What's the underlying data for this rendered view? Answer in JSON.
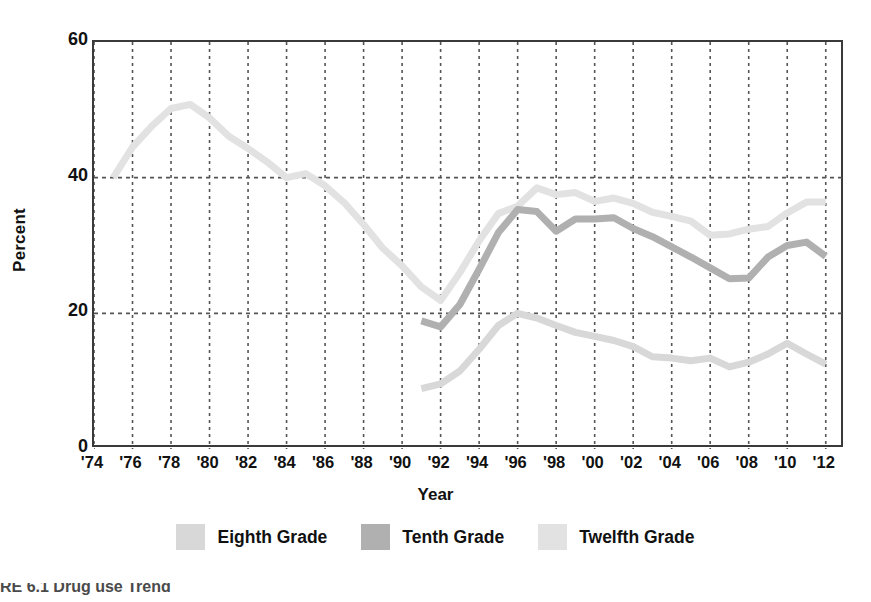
{
  "figure": {
    "caption": "RE 6.1  Drug use Trend"
  },
  "axes": {
    "y_title": "Percent",
    "x_title": "Year",
    "y_ticks": [
      "0",
      "20",
      "40",
      "60"
    ],
    "x_ticks": [
      "'74",
      "'76",
      "'78",
      "'80",
      "'82",
      "'84",
      "'86",
      "'88",
      "'90",
      "'92",
      "'94",
      "'96",
      "'98",
      "'00",
      "'02",
      "'04",
      "'06",
      "'08",
      "'10",
      "'12"
    ]
  },
  "legend": {
    "items": [
      {
        "label": "Eighth Grade",
        "color": "#d8d8d8"
      },
      {
        "label": "Tenth Grade",
        "color": "#b0b0b0"
      },
      {
        "label": "Twelfth Grade",
        "color": "#e2e2e2"
      }
    ]
  },
  "colors": {
    "eighth": "#d8d8d8",
    "tenth": "#b0b0b0",
    "twelfth": "#e2e2e2",
    "axis": "#3a3a3a",
    "grid": "#555555",
    "text": "#111111"
  },
  "chart_data": {
    "type": "line",
    "title": "",
    "xlabel": "Year",
    "ylabel": "Percent",
    "xlim": [
      1974,
      2013
    ],
    "ylim": [
      0,
      60
    ],
    "grid": "dashed vertical gridlines every 2 years; dashed horizontal gridlines at 20 and 40",
    "legend_position": "below plot, centered",
    "x": [
      1975,
      1976,
      1977,
      1978,
      1979,
      1980,
      1981,
      1982,
      1983,
      1984,
      1985,
      1986,
      1987,
      1988,
      1989,
      1990,
      1991,
      1992,
      1993,
      1994,
      1995,
      1996,
      1997,
      1998,
      1999,
      2000,
      2001,
      2002,
      2003,
      2004,
      2005,
      2006,
      2007,
      2008,
      2009,
      2010,
      2011,
      2012
    ],
    "series": [
      {
        "name": "Twelfth Grade",
        "color": "#e2e2e2",
        "x": [
          1975,
          1976,
          1977,
          1978,
          1979,
          1980,
          1981,
          1982,
          1983,
          1984,
          1985,
          1986,
          1987,
          1988,
          1989,
          1990,
          1991,
          1992,
          1993,
          1994,
          1995,
          1996,
          1997,
          1998,
          1999,
          2000,
          2001,
          2002,
          2003,
          2004,
          2005,
          2006,
          2007,
          2008,
          2009,
          2010,
          2011,
          2012
        ],
        "values": [
          40.0,
          44.5,
          47.6,
          50.2,
          50.8,
          48.8,
          46.1,
          44.3,
          42.3,
          40.0,
          40.6,
          38.8,
          36.3,
          33.1,
          29.6,
          27.0,
          23.9,
          21.9,
          26.0,
          30.7,
          34.7,
          35.8,
          38.5,
          37.5,
          37.8,
          36.5,
          37.0,
          36.2,
          34.9,
          34.3,
          33.6,
          31.5,
          31.7,
          32.4,
          32.8,
          34.8,
          36.4,
          36.4
        ]
      },
      {
        "name": "Tenth Grade",
        "color": "#b0b0b0",
        "x": [
          1991,
          1992,
          1993,
          1994,
          1995,
          1996,
          1997,
          1998,
          1999,
          2000,
          2001,
          2002,
          2003,
          2004,
          2005,
          2006,
          2007,
          2008,
          2009,
          2010,
          2011,
          2012
        ],
        "values": [
          18.9,
          18.0,
          21.3,
          26.5,
          31.9,
          35.3,
          35.0,
          32.1,
          33.9,
          33.9,
          34.1,
          32.5,
          31.3,
          29.8,
          28.3,
          26.7,
          25.1,
          25.2,
          28.3,
          30.0,
          30.5,
          28.4
        ]
      },
      {
        "name": "Eighth Grade",
        "color": "#d8d8d8",
        "x": [
          1991,
          1992,
          1993,
          1994,
          1995,
          1996,
          1997,
          1998,
          1999,
          2000,
          2001,
          2002,
          2003,
          2004,
          2005,
          2006,
          2007,
          2008,
          2009,
          2010,
          2011,
          2012
        ],
        "values": [
          8.9,
          9.6,
          11.5,
          14.7,
          18.2,
          20.0,
          19.3,
          18.2,
          17.2,
          16.6,
          16.0,
          15.1,
          13.6,
          13.4,
          13.0,
          13.4,
          12.1,
          12.8,
          14.0,
          15.6,
          14.0,
          12.5
        ]
      }
    ]
  }
}
